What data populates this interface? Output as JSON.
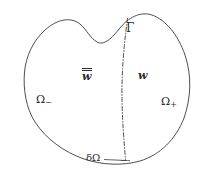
{
  "figure": {
    "background_color": "#ffffff",
    "stroke_color": "#3a3a3a",
    "width": 205,
    "height": 174,
    "labels": {
      "interface": "Γ",
      "field_left": "w",
      "field_right": "w",
      "subdomain_left_base": "Ω",
      "subdomain_left_sub": "−",
      "subdomain_right_base": "Ω",
      "subdomain_right_sub": "+",
      "boundary": "δΩ"
    },
    "elements": {
      "outer_boundary_name": "domain-outer-boundary",
      "interface_name": "interface-curve",
      "leader_name": "boundary-leader-line"
    }
  }
}
